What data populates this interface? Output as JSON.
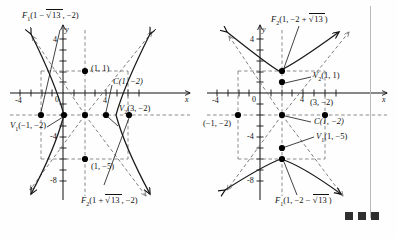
{
  "figure": {
    "colors": {
      "ink": "#111111",
      "curve": "#1a1a1a",
      "dash": "#6f6f6f",
      "marker": "#000000",
      "swatch": "#2f2f2f",
      "divider": "#b9b9b9"
    }
  },
  "left_panel": {
    "name": "horizontal-transverse-hyperbola",
    "axis": {
      "x_label": "x",
      "y_label": "y",
      "origin_label": "0",
      "x_ticks": [
        -4,
        4
      ],
      "y_ticks": [
        4,
        -4,
        -8
      ],
      "x_tick_labels": [
        "-4",
        "4"
      ],
      "y_tick_labels": [
        "4",
        "-4",
        "-8"
      ]
    },
    "labels": [
      {
        "name": "focus-1-label",
        "text": "F",
        "sub": "1",
        "rest_a": "(1 − ",
        "radical": "13",
        "rest_b": ", −2)"
      },
      {
        "name": "focus-2-label",
        "text": "F",
        "sub": "2",
        "rest_a": "(1 + ",
        "radical": "13",
        "rest_b": ", −2)"
      },
      {
        "name": "center-label",
        "text": "C(1, −2)"
      },
      {
        "name": "vertex-1-label",
        "text": "V",
        "sub": "1",
        "rest_a": "(−1, −2)"
      },
      {
        "name": "vertex-2-label",
        "text": "V",
        "sub": "2",
        "rest_a": "(3, −2)"
      },
      {
        "name": "point-top-label",
        "text": "(1, 1)"
      },
      {
        "name": "point-bottom-label",
        "text": "(1, −5)"
      }
    ]
  },
  "right_panel": {
    "name": "vertical-transverse-hyperbola",
    "axis": {
      "x_label": "x",
      "y_label": "y",
      "origin_label": "0",
      "x_ticks": [
        -4,
        4
      ],
      "y_ticks": [
        4,
        -4,
        -8
      ],
      "x_tick_labels": [
        "-4",
        "4"
      ],
      "y_tick_labels": [
        "4",
        "-4",
        "-8"
      ]
    },
    "labels": [
      {
        "name": "focus-2-label",
        "text": "F",
        "sub": "2",
        "rest_a": "(1, −2 + ",
        "radical": "13",
        "rest_b": ")"
      },
      {
        "name": "focus-1-label",
        "text": "F",
        "sub": "1",
        "rest_a": "(1, −2 − ",
        "radical": "13",
        "rest_b": ")"
      },
      {
        "name": "center-label",
        "text": "C(1, −2)"
      },
      {
        "name": "vertex-2-label",
        "text": "V",
        "sub": "2",
        "rest_a": "(1, 1)"
      },
      {
        "name": "vertex-1-label",
        "text": "V",
        "sub": "1",
        "rest_a": "(1, −5)"
      },
      {
        "name": "point-left-label",
        "text": "(−1, −2)"
      },
      {
        "name": "point-right-label",
        "text": "(3, −2)"
      }
    ]
  },
  "footer_marks": {
    "name": "color-swatches",
    "count": 3
  }
}
